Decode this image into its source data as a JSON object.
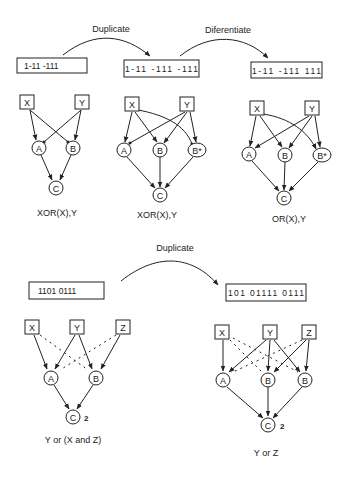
{
  "top": {
    "arrows": [
      {
        "label": "Duplicate"
      },
      {
        "label": "Diferentiate"
      }
    ],
    "panels": [
      {
        "code": "1-11   -111",
        "inputs": [
          "X",
          "Y"
        ],
        "hidden": [
          "A",
          "B"
        ],
        "output": "C",
        "caption": "XOR(X),Y"
      },
      {
        "code": "1-11  -111  -111",
        "inputs": [
          "X",
          "Y"
        ],
        "hidden": [
          "A",
          "B",
          "B*"
        ],
        "output": "C",
        "caption": "XOR(X),Y"
      },
      {
        "code": "1-11  -111  111",
        "inputs": [
          "X",
          "Y"
        ],
        "hidden": [
          "A",
          "B",
          "B*"
        ],
        "output": "C",
        "caption": "OR(X),Y"
      }
    ]
  },
  "bottom": {
    "arrow": {
      "label": "Duplicate"
    },
    "panels": [
      {
        "code": "1101  0111",
        "inputs": [
          "X",
          "Y",
          "Z"
        ],
        "hidden": [
          "A",
          "B"
        ],
        "output": "C",
        "threshold": "2",
        "caption": "Y or (X and Z)"
      },
      {
        "code": "101  01111  0111",
        "inputs": [
          "X",
          "Y",
          "Z"
        ],
        "hidden": [
          "A",
          "B",
          "B"
        ],
        "output": "C",
        "threshold": "2",
        "caption": "Y or Z"
      }
    ]
  }
}
